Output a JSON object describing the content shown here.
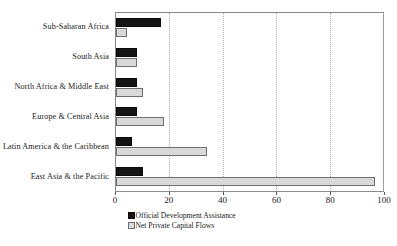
{
  "chart_data": {
    "type": "bar",
    "orientation": "horizontal",
    "title": "",
    "subtitle": "",
    "xlabel": "",
    "ylabel": "",
    "xlim": [
      0,
      100
    ],
    "ylim": null,
    "xticks": [
      0,
      20,
      40,
      60,
      80,
      100
    ],
    "xtick_labels": [
      "0",
      "20",
      "40",
      "60",
      "80",
      "100"
    ],
    "grid": true,
    "grid_axis": "x",
    "grid_style": "dotted",
    "legend_position": "bottom-center",
    "categories": [
      "Sub-Saharan Africa",
      "South Asia",
      "North Africa & Middle East",
      "Europe & Central Asia",
      "Latin America & the Caribbean",
      "East Asia & the Pacific"
    ],
    "series": [
      {
        "name": "Official Development Assistance",
        "color": "#141414",
        "border_color": "#0a0a0a",
        "values": [
          17,
          8,
          8,
          8,
          6,
          10
        ]
      },
      {
        "name": "Net Private Capital Flows",
        "color": "#d9d9d9",
        "border_color": "#6e6e6e",
        "values": [
          4,
          8,
          10,
          18,
          34,
          97
        ]
      }
    ],
    "annotations": []
  },
  "legend": {
    "items": [
      {
        "label": "Official Development Assistance",
        "swatch": "black-square-swatch"
      },
      {
        "label": "Net Private Capital Flows",
        "swatch": "light-gray-square-swatch"
      }
    ]
  },
  "colors": {
    "series_a": "#141414",
    "series_b": "#d9d9d9",
    "axis": "#8a8a8a",
    "gridline": "#b4b4b4",
    "text": "#1a1a1a",
    "background": "#ffffff"
  }
}
